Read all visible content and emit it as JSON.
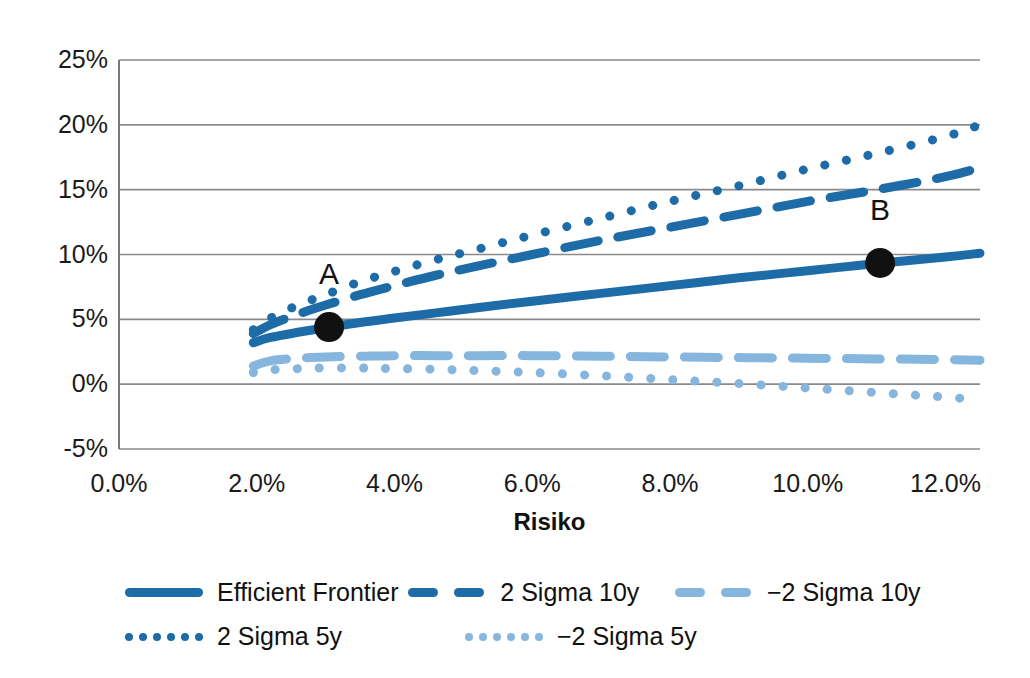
{
  "chart_data": {
    "type": "line",
    "title": "",
    "xlabel": "Risiko",
    "ylabel": "",
    "xlim": [
      0.0,
      12.5
    ],
    "ylim": [
      -5,
      25
    ],
    "grid": true,
    "legend_position": "bottom",
    "x_ticks": [
      "0.0%",
      "2.0%",
      "4.0%",
      "6.0%",
      "8.0%",
      "10.0%",
      "12.0%"
    ],
    "x_tick_values": [
      0.0,
      2.0,
      4.0,
      6.0,
      8.0,
      10.0,
      12.0
    ],
    "y_ticks": [
      "-5%",
      "0%",
      "5%",
      "10%",
      "15%",
      "20%",
      "25%"
    ],
    "y_tick_values": [
      -5,
      0,
      5,
      10,
      15,
      20,
      25
    ],
    "x": [
      1.95,
      2.2,
      2.6,
      3.0,
      3.5,
      4.0,
      4.6,
      5.2,
      6.0,
      7.0,
      8.0,
      9.0,
      10.0,
      11.0,
      12.0,
      12.5
    ],
    "series": [
      {
        "name": "Efficient Frontier",
        "style": "solid",
        "color": "#1D6CA8",
        "values": [
          3.2,
          3.6,
          4.0,
          4.35,
          4.75,
          5.1,
          5.5,
          5.9,
          6.4,
          7.0,
          7.6,
          8.2,
          8.75,
          9.3,
          9.8,
          10.1
        ]
      },
      {
        "name": "2 Sigma 10y",
        "style": "dashed",
        "color": "#1D6CA8",
        "values": [
          3.9,
          4.6,
          5.4,
          6.1,
          6.9,
          7.6,
          8.4,
          9.1,
          10.0,
          11.1,
          12.1,
          13.1,
          14.1,
          15.0,
          16.0,
          16.7
        ]
      },
      {
        "name": "2 Sigma 5y",
        "style": "dotted",
        "color": "#1D6CA8",
        "values": [
          4.2,
          5.1,
          6.1,
          6.9,
          7.9,
          8.7,
          9.6,
          10.4,
          11.5,
          12.8,
          14.1,
          15.3,
          16.6,
          17.8,
          19.1,
          20.0
        ]
      },
      {
        "name": "−2 Sigma 10y",
        "style": "dashed",
        "color": "#86B6DD",
        "values": [
          1.4,
          1.8,
          2.0,
          2.1,
          2.15,
          2.2,
          2.2,
          2.2,
          2.2,
          2.15,
          2.1,
          2.05,
          2.0,
          1.95,
          1.9,
          1.85
        ]
      },
      {
        "name": "−2 Sigma 5y",
        "style": "dotted",
        "color": "#86B6DD",
        "values": [
          0.9,
          1.1,
          1.2,
          1.25,
          1.25,
          1.2,
          1.15,
          1.05,
          0.9,
          0.65,
          0.35,
          0.05,
          -0.3,
          -0.65,
          -1.0,
          -1.2
        ]
      }
    ],
    "annotations": [
      {
        "label": "A",
        "x": 3.05,
        "y": 4.4,
        "marker": "filled-circle",
        "color": "#111111"
      },
      {
        "label": "B",
        "x": 11.05,
        "y": 9.35,
        "marker": "filled-circle",
        "color": "#111111"
      }
    ]
  },
  "axes": {
    "x_title": "Risiko",
    "frame_color": "#7a7a7a",
    "grid_color": "#8a8a8a"
  },
  "legend": {
    "rows": [
      [
        {
          "label": "Efficient Frontier",
          "style": "solid",
          "color": "#1D6CA8"
        },
        {
          "label": "2 Sigma 10y",
          "style": "dashed",
          "color": "#1D6CA8"
        },
        {
          "label": "−2 Sigma 10y",
          "style": "dashed",
          "color": "#86B6DD"
        }
      ],
      [
        {
          "label": "2 Sigma 5y",
          "style": "dotted",
          "color": "#1D6CA8"
        },
        {
          "label": "−2 Sigma 5y",
          "style": "dotted",
          "color": "#86B6DD"
        }
      ]
    ]
  }
}
